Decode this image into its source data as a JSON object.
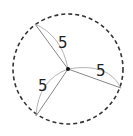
{
  "diagram": {
    "type": "circle-radii",
    "circle": {
      "cx": 68,
      "cy": 69,
      "r": 55,
      "stroke": "#333333",
      "dashed": true
    },
    "center": {
      "x": 68,
      "y": 69,
      "color": "#111111"
    },
    "radii": [
      {
        "x": 35,
        "y": 24,
        "label": "5",
        "lx": 58,
        "ly": 47
      },
      {
        "x": 121,
        "y": 88,
        "label": "5",
        "lx": 102,
        "ly": 76
      },
      {
        "x": 36,
        "y": 116,
        "label": "5",
        "lx": 42,
        "ly": 90
      }
    ],
    "line_color": "#888888"
  }
}
